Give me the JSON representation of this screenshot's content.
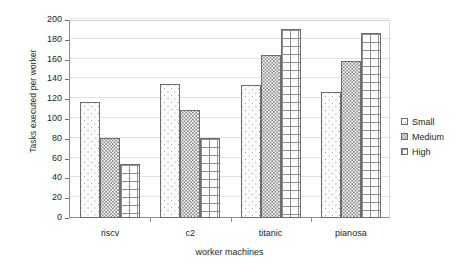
{
  "chart_data": {
    "type": "bar",
    "title": "",
    "xlabel": "worker machines",
    "ylabel": "Tasks executed per worker",
    "categories": [
      "riscv",
      "c2",
      "titanic",
      "pianosa"
    ],
    "series": [
      {
        "name": "Small",
        "values": [
          117,
          135,
          134,
          127
        ],
        "pattern": "light-dots"
      },
      {
        "name": "Medium",
        "values": [
          81,
          109,
          165,
          159
        ],
        "pattern": "dense-dots"
      },
      {
        "name": "High",
        "values": [
          55,
          81,
          191,
          187
        ],
        "pattern": "grid-hatch"
      }
    ],
    "ylim": [
      0,
      200
    ],
    "ytick_values": [
      0,
      20,
      40,
      60,
      80,
      100,
      120,
      140,
      160,
      180,
      200
    ],
    "ytick_labels": [
      "0",
      "20",
      "40",
      "60",
      "80",
      "100",
      "120",
      "140",
      "160",
      "180",
      "200"
    ],
    "grid": true,
    "grid_axis": "y",
    "legend_position": "right",
    "legend_entries": [
      "Small",
      "Medium",
      "High"
    ],
    "colors": {
      "axis": "#8d8d8d",
      "grid": "#e2e2e2",
      "bar_outline": "#6d6d6d",
      "text": "#231f20",
      "background": "#ffffff"
    }
  }
}
